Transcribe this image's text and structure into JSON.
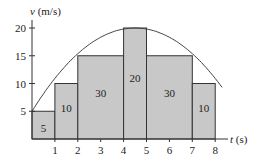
{
  "chart_data": {
    "type": "bar",
    "title": "",
    "xlabel": "t (s)",
    "ylabel": "v (m/s)",
    "x_ticks": [
      "1",
      "2",
      "3",
      "4",
      "5",
      "6",
      "7",
      "8"
    ],
    "y_ticks": [
      "5",
      "10",
      "15",
      "20"
    ],
    "xlim": [
      0,
      8
    ],
    "ylim": [
      0,
      20
    ],
    "grid": false,
    "bars": [
      {
        "x0": 0,
        "x1": 1,
        "height": 5,
        "area_label": "5"
      },
      {
        "x0": 1,
        "x1": 2,
        "height": 10,
        "area_label": "10"
      },
      {
        "x0": 2,
        "x1": 4,
        "height": 15,
        "area_label": "30"
      },
      {
        "x0": 4,
        "x1": 5,
        "height": 20,
        "area_label": "20"
      },
      {
        "x0": 5,
        "x1": 7,
        "height": 15,
        "area_label": "30"
      },
      {
        "x0": 7,
        "x1": 8,
        "height": 10,
        "area_label": "10"
      }
    ],
    "curve": {
      "type": "parabola",
      "description": "v(t) curve starting at (0,5), peaking at (4.5,20), ending at (8,10)"
    },
    "colors": {
      "bar_fill": "#c8c8c8",
      "line": "#333333",
      "curve": "#444444"
    }
  },
  "labels": {
    "ylabel_var": "v",
    "ylabel_unit": " (m/s)",
    "xlabel_var": "t",
    "xlabel_unit": " (s)"
  }
}
